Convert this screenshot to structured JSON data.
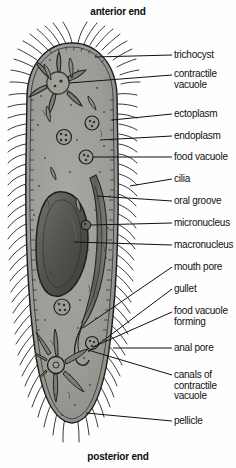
{
  "figure": {
    "anterior_title": "anterior end",
    "posterior_title": "posterior end",
    "style": {
      "cytoplasm_color": "#9a9a95",
      "endoplasm_color": "#8e8e88",
      "outline_color": "#1a1a1a",
      "organelle_dark": "#55544f",
      "label_color": "#111111",
      "background": "#fefefe"
    }
  },
  "labels": [
    {
      "id": "trichocyst",
      "text": "trichocyst",
      "lines": 1
    },
    {
      "id": "contractile-vacuole",
      "text": "contractile\nvacuole",
      "lines": 2
    },
    {
      "id": "ectoplasm",
      "text": "ectoplasm",
      "lines": 1
    },
    {
      "id": "endoplasm",
      "text": "endoplasm",
      "lines": 1
    },
    {
      "id": "food-vacuole",
      "text": "food vacuole",
      "lines": 1
    },
    {
      "id": "cilia",
      "text": "cilia",
      "lines": 1
    },
    {
      "id": "oral-groove",
      "text": "oral groove",
      "lines": 1
    },
    {
      "id": "micronucleus",
      "text": "micronucleus",
      "lines": 1
    },
    {
      "id": "macronucleus",
      "text": "macronucleus",
      "lines": 1
    },
    {
      "id": "mouth-pore",
      "text": "mouth pore",
      "lines": 1
    },
    {
      "id": "gullet",
      "text": "gullet",
      "lines": 1
    },
    {
      "id": "food-vacuole-forming",
      "text": "food vacuole\nforming",
      "lines": 2
    },
    {
      "id": "anal-pore",
      "text": "anal  pore",
      "lines": 1
    },
    {
      "id": "canals-of-contractile-vacuole",
      "text": "canals of\ncontractile\nvacuole",
      "lines": 3
    },
    {
      "id": "pellicle",
      "text": "pellicle",
      "lines": 1
    }
  ],
  "structures": [
    "cilia-fringe",
    "pellicle-membrane",
    "ectoplasm-layer",
    "endoplasm-region",
    "anterior-contractile-vacuole",
    "posterior-contractile-vacuole",
    "radiating-canals",
    "macronucleus",
    "micronucleus",
    "oral-groove",
    "mouth-pore",
    "gullet",
    "food-vacuoles",
    "trichocysts",
    "anal-pore"
  ]
}
